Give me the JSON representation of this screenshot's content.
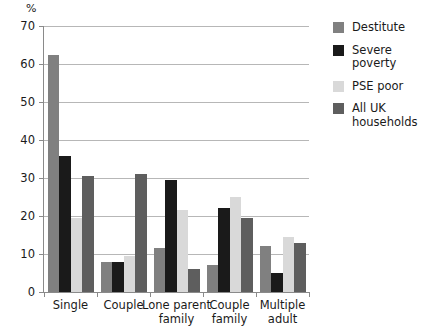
{
  "chart_data": {
    "type": "bar",
    "title": "",
    "xlabel": "",
    "ylabel": "%",
    "ylim": [
      0,
      70
    ],
    "yticks": [
      0,
      10,
      20,
      30,
      40,
      50,
      60,
      70
    ],
    "grid": true,
    "legend_position": "right",
    "categories": [
      "Single",
      "Couple",
      "Lone parent\nfamily",
      "Couple\nfamily",
      "Multiple\nadult"
    ],
    "series": [
      {
        "name": "Destitute",
        "color": "#808080",
        "values": [
          62.5,
          8,
          11.5,
          7,
          12
        ]
      },
      {
        "name": "Severe poverty",
        "color": "#1a1a1a",
        "values": [
          35.8,
          8,
          29.5,
          22,
          5
        ]
      },
      {
        "name": "PSE poor",
        "color": "#d9d9d9",
        "values": [
          19.5,
          9.5,
          21.5,
          25,
          14.5
        ]
      },
      {
        "name": "All UK households",
        "color": "#5e5e5e",
        "values": [
          30.5,
          31,
          6,
          19.5,
          13
        ]
      }
    ]
  },
  "legend": {
    "items": [
      {
        "label": "Destitute",
        "color": "#808080"
      },
      {
        "label": "Severe\npoverty",
        "color": "#1a1a1a"
      },
      {
        "label": "PSE poor",
        "color": "#d9d9d9"
      },
      {
        "label": "All UK\nhouseholds",
        "color": "#5e5e5e"
      }
    ]
  },
  "axis": {
    "y_unit": "%"
  }
}
